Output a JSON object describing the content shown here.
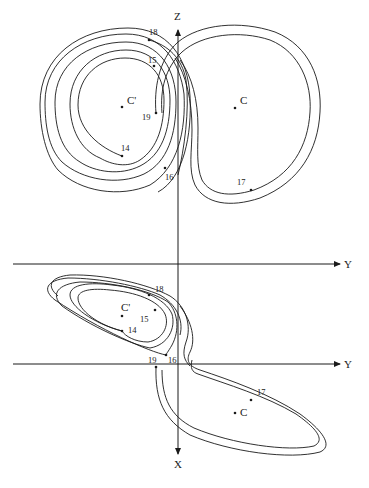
{
  "figure": {
    "top_panel": {
      "title": "Z-Y projection",
      "axis_vertical_label": "Z",
      "axis_horizontal_label": "Y",
      "fixed_points": [
        {
          "label": "C'",
          "x": 122,
          "y": 107
        },
        {
          "label": "C",
          "x": 235,
          "y": 108
        }
      ],
      "trajectory_points": [
        {
          "label": "14",
          "x": 122,
          "y": 156
        },
        {
          "label": "15",
          "x": 154,
          "y": 66
        },
        {
          "label": "16",
          "x": 165,
          "y": 168
        },
        {
          "label": "17",
          "x": 251,
          "y": 190
        },
        {
          "label": "18",
          "x": 149,
          "y": 40
        },
        {
          "label": "19",
          "x": 156,
          "y": 113
        }
      ]
    },
    "bottom_panel": {
      "title": "X-Y projection",
      "axis_vertical_label": "X",
      "axis_horizontal_label": "Y",
      "fixed_points": [
        {
          "label": "C'",
          "x": 122,
          "y": 316
        },
        {
          "label": "C",
          "x": 235,
          "y": 413
        }
      ],
      "trajectory_points": [
        {
          "label": "14",
          "x": 122,
          "y": 331
        },
        {
          "label": "15",
          "x": 155,
          "y": 310
        },
        {
          "label": "16",
          "x": 166,
          "y": 355
        },
        {
          "label": "17",
          "x": 251,
          "y": 400
        },
        {
          "label": "18",
          "x": 149,
          "y": 295
        },
        {
          "label": "19",
          "x": 156,
          "y": 367
        }
      ]
    }
  },
  "labels": {
    "z": "Z",
    "y_top": "Y",
    "y_bottom": "Y",
    "x": "X",
    "c_prime_top": "C'",
    "c_top": "C",
    "c_prime_bottom": "C'",
    "c_bottom": "C",
    "p14_top": "14",
    "p15_top": "15",
    "p16_top": "16",
    "p17_top": "17",
    "p18_top": "18",
    "p19_top": "19",
    "p14_bot": "14",
    "p15_bot": "15",
    "p16_bot": "16",
    "p17_bot": "17",
    "p18_bot": "18",
    "p19_bot": "19"
  }
}
